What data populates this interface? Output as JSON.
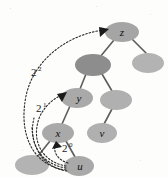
{
  "figure": {
    "type": "tree-diagram",
    "background_color": "#fdfdfb",
    "edge_color": "#5d5d5d",
    "arrow_color": "#2a2a2a",
    "node_fill_normal": "#b6b6b6",
    "node_fill_highlight": "#8f8f8f",
    "node_fill_root": "#a8a8a8"
  },
  "nodes": [
    {
      "id": "z",
      "label": "z",
      "cx": 122,
      "cy": 32,
      "rx": 17,
      "ry": 10,
      "fill": "#a5a5a5",
      "labeled": true
    },
    {
      "id": "zright",
      "label": "",
      "cx": 148,
      "cy": 63,
      "rx": 16,
      "ry": 10,
      "fill": "#b3b3b3",
      "labeled": false
    },
    {
      "id": "mid",
      "label": "",
      "cx": 93,
      "cy": 65,
      "rx": 18,
      "ry": 11,
      "fill": "#8d8d8d",
      "labeled": false
    },
    {
      "id": "y",
      "label": "y",
      "cx": 77,
      "cy": 98,
      "rx": 16,
      "ry": 10,
      "fill": "#a9a9a9",
      "labeled": true
    },
    {
      "id": "midr",
      "label": "",
      "cx": 116,
      "cy": 100,
      "rx": 16,
      "ry": 10,
      "fill": "#b0b0b0",
      "labeled": false
    },
    {
      "id": "x",
      "label": "x",
      "cx": 58,
      "cy": 133,
      "rx": 16,
      "ry": 10,
      "fill": "#a9a9a9",
      "labeled": true
    },
    {
      "id": "v",
      "label": "v",
      "cx": 102,
      "cy": 133,
      "rx": 15,
      "ry": 10,
      "fill": "#b0b0b0",
      "labeled": true
    },
    {
      "id": "bl",
      "label": "",
      "cx": 32,
      "cy": 165,
      "rx": 17,
      "ry": 10,
      "fill": "#b3b3b3",
      "labeled": false
    },
    {
      "id": "u",
      "label": "u",
      "cx": 79,
      "cy": 166,
      "rx": 15,
      "ry": 10,
      "fill": "#a9a9a9",
      "labeled": true
    }
  ],
  "edges": [
    {
      "from": "z",
      "to": "mid"
    },
    {
      "from": "z",
      "to": "zright"
    },
    {
      "from": "mid",
      "to": "y"
    },
    {
      "from": "mid",
      "to": "midr"
    },
    {
      "from": "y",
      "to": "x"
    },
    {
      "from": "midr",
      "to": "v"
    },
    {
      "from": "x",
      "to": "bl"
    },
    {
      "from": "x",
      "to": "u"
    }
  ],
  "jump_pointers": [
    {
      "id": "jump0",
      "base": "2",
      "exponent": "0",
      "from": "u",
      "to": "x",
      "label_x": 64,
      "label_y": 151
    },
    {
      "id": "jump1",
      "base": "2",
      "exponent": "1",
      "from": "u",
      "to": "y",
      "label_x": 39,
      "label_y": 110
    },
    {
      "id": "jump2",
      "base": "2",
      "exponent": "2",
      "from": "u",
      "to": "z",
      "label_x": 34,
      "label_y": 74
    }
  ],
  "node_labels": {
    "z": "z",
    "y": "y",
    "x": "x",
    "v": "v",
    "u": "u"
  },
  "jump_labels": {
    "jump0_base": "2",
    "jump0_exp": "0",
    "jump1_base": "2",
    "jump1_exp": "1",
    "jump2_base": "2",
    "jump2_exp": "2"
  }
}
